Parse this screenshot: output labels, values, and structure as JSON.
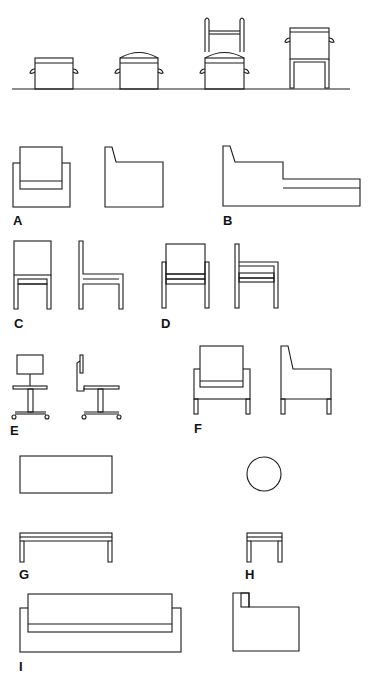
{
  "figure": {
    "groups": [
      {
        "id": "A",
        "label": "A",
        "items": [
          "armchair-front",
          "armchair-side"
        ]
      },
      {
        "id": "B",
        "label": "B",
        "items": [
          "chaise-side"
        ]
      },
      {
        "id": "C",
        "label": "C",
        "items": [
          "side-chair-front",
          "side-chair-side"
        ]
      },
      {
        "id": "D",
        "label": "D",
        "items": [
          "armchair-open-front",
          "armchair-open-side"
        ]
      },
      {
        "id": "E",
        "label": "E",
        "items": [
          "task-chair-front",
          "task-chair-side"
        ]
      },
      {
        "id": "F",
        "label": "F",
        "items": [
          "lounge-chair-front",
          "lounge-chair-side"
        ]
      },
      {
        "id": "G",
        "label": "G",
        "items": [
          "coffee-table-top",
          "coffee-table-side"
        ]
      },
      {
        "id": "H",
        "label": "H",
        "items": [
          "round-table-top",
          "round-table-side"
        ]
      },
      {
        "id": "I",
        "label": "I",
        "items": [
          "sofa-front",
          "sofa-side"
        ]
      }
    ],
    "stroke_color": "#1a1a1a",
    "background": "#ffffff"
  },
  "labels": {
    "A": "A",
    "B": "B",
    "C": "C",
    "D": "D",
    "E": "E",
    "F": "F",
    "G": "G",
    "H": "H",
    "I": "I"
  }
}
